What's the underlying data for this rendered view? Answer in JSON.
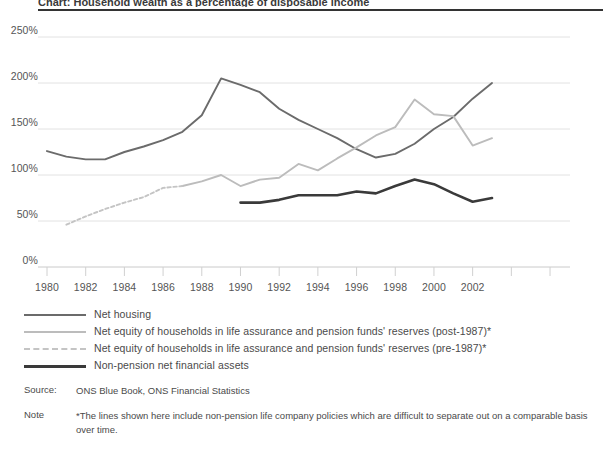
{
  "title": "Chart: Household wealth as a percentage of disposable income",
  "source": {
    "label": "Source:",
    "text": "ONS Blue Book, ONS Financial Statistics"
  },
  "note": {
    "label": "Note",
    "text": "*The lines shown here include non-pension life company policies which are difficult to separate out on a comparable basis over time."
  },
  "legend": [
    {
      "label": "Net housing",
      "color": "#6b6b6b",
      "style": "solid",
      "width": 2
    },
    {
      "label": "Net equity of households in life assurance and pension funds' reserves (post-1987)*",
      "color": "#bcbcbc",
      "style": "solid",
      "width": 2
    },
    {
      "label": "Net equity of households in life assurance and pension funds' reserves (pre-1987)*",
      "color": "#c4c4c4",
      "style": "dashed",
      "width": 2
    },
    {
      "label": "Non-pension net financial assets",
      "color": "#3a3a3a",
      "style": "solid",
      "width": 2.6
    }
  ],
  "chart_data": {
    "type": "line",
    "title": "Household wealth as a percentage of disposable income",
    "xlabel": "",
    "ylabel": "",
    "xlim": [
      1980,
      2003
    ],
    "ylim": [
      0,
      250
    ],
    "yticks": [
      0,
      50,
      100,
      150,
      200,
      250
    ],
    "ytick_labels": [
      "0%",
      "50%",
      "100%",
      "150%",
      "200%",
      "250%"
    ],
    "xticks": [
      1980,
      1982,
      1984,
      1986,
      1988,
      1990,
      1992,
      1994,
      1996,
      1998,
      2000,
      2002
    ],
    "xtick_labels": [
      "1980",
      "1982",
      "1984",
      "1986",
      "1988",
      "1990",
      "1992",
      "1994",
      "1996",
      "1998",
      "2000",
      "2002"
    ],
    "grid": "horizontal",
    "legend_position": "below",
    "series": [
      {
        "name": "Net housing",
        "color": "#6b6b6b",
        "style": "solid",
        "x": [
          1980,
          1981,
          1982,
          1983,
          1984,
          1985,
          1986,
          1987,
          1988,
          1989,
          1990,
          1991,
          1992,
          1993,
          1994,
          1995,
          1996,
          1997,
          1998,
          1999,
          2000,
          2001,
          2002,
          2003
        ],
        "values": [
          126,
          120,
          117,
          117,
          125,
          131,
          138,
          147,
          165,
          205,
          198,
          190,
          172,
          160,
          150,
          140,
          128,
          119,
          123,
          134,
          150,
          163,
          183,
          200
        ]
      },
      {
        "name": "Net equity of households in life assurance and pension funds' reserves (post-1987)*",
        "color": "#bcbcbc",
        "style": "solid",
        "x": [
          1987,
          1988,
          1989,
          1990,
          1991,
          1992,
          1993,
          1994,
          1995,
          1996,
          1997,
          1998,
          1999,
          2000,
          2001,
          2002,
          2003
        ],
        "values": [
          88,
          93,
          100,
          88,
          95,
          97,
          112,
          105,
          118,
          130,
          143,
          152,
          182,
          166,
          164,
          132,
          140
        ]
      },
      {
        "name": "Net equity of households in life assurance and pension funds' reserves (pre-1987)*",
        "color": "#c4c4c4",
        "style": "dashed",
        "x": [
          1981,
          1982,
          1983,
          1984,
          1985,
          1986,
          1987
        ],
        "values": [
          46,
          55,
          63,
          70,
          76,
          86,
          88
        ]
      },
      {
        "name": "Non-pension net financial assets",
        "color": "#3a3a3a",
        "style": "solid",
        "x": [
          1990,
          1991,
          1992,
          1993,
          1994,
          1995,
          1996,
          1997,
          1998,
          1999,
          2000,
          2001,
          2002,
          2003
        ],
        "values": [
          70,
          70,
          73,
          78,
          78,
          78,
          82,
          80,
          88,
          95,
          90,
          80,
          71,
          75
        ]
      }
    ]
  }
}
